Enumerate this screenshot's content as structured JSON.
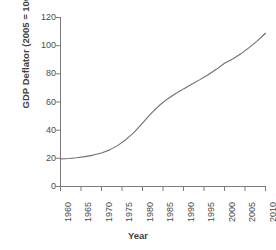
{
  "chart_data": {
    "type": "line",
    "title": "",
    "xlabel": "Year",
    "ylabel": "GDP Deflator (2005 = 100)",
    "xlim": [
      1960,
      2010
    ],
    "ylim": [
      0,
      120
    ],
    "xticks": [
      "1960",
      "1965",
      "1970",
      "1975",
      "1980",
      "1985",
      "1990",
      "1995",
      "2000",
      "2005",
      "2010"
    ],
    "yticks": [
      "0",
      "20",
      "40",
      "60",
      "80",
      "100",
      "120"
    ],
    "grid": false,
    "legend": null,
    "line_color": "#6e6e6e",
    "axis_color": "#7a7a7a",
    "series": [
      {
        "name": "GDP Deflator (2005 = 100)",
        "x": [
          1960,
          1962,
          1964,
          1966,
          1968,
          1970,
          1972,
          1974,
          1976,
          1978,
          1980,
          1982,
          1984,
          1986,
          1988,
          1990,
          1992,
          1994,
          1996,
          1998,
          2000,
          2002,
          2004,
          2006,
          2008,
          2010
        ],
        "values": [
          19.6,
          19.9,
          20.4,
          21.2,
          22.3,
          23.8,
          26.0,
          29.2,
          33.4,
          38.6,
          45.0,
          51.5,
          57.3,
          62.0,
          65.8,
          69.3,
          72.6,
          75.9,
          79.4,
          83.2,
          87.5,
          90.6,
          94.2,
          98.6,
          103.4,
          108.8
        ]
      }
    ]
  },
  "axes": {
    "y_tick_values": [
      0,
      20,
      40,
      60,
      80,
      100,
      120
    ],
    "x_tick_values": [
      1960,
      1965,
      1970,
      1975,
      1980,
      1985,
      1990,
      1995,
      2000,
      2005,
      2010
    ]
  }
}
